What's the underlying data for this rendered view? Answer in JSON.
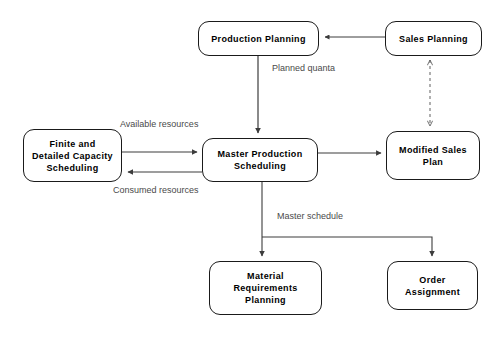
{
  "diagram": {
    "background_color": "#ffffff",
    "line_color": "#3c3c3c",
    "node_border_color": "#1a1a1a",
    "node_text_color": "#000000",
    "edge_label_color": "#4a4a4a",
    "nodes": [
      {
        "id": "production-planning",
        "label": "Production Planning"
      },
      {
        "id": "sales-planning",
        "label": "Sales Planning"
      },
      {
        "id": "finite-capacity",
        "label": "Finite and\nDetailed Capacity\nScheduling"
      },
      {
        "id": "master-production",
        "label": "Master Production\nScheduling"
      },
      {
        "id": "modified-sales",
        "label": "Modified Sales\nPlan"
      },
      {
        "id": "material-req",
        "label": "Material\nRequirements\nPlanning"
      },
      {
        "id": "order-assignment",
        "label": "Order\nAssignment"
      }
    ],
    "edges": [
      {
        "id": "sales-to-production",
        "from": "sales-planning",
        "to": "production-planning",
        "label": "",
        "style": "solid",
        "arrows": "single"
      },
      {
        "id": "production-to-mps",
        "from": "production-planning",
        "to": "master-production",
        "label": "Planned quanta",
        "style": "solid",
        "arrows": "single"
      },
      {
        "id": "fcs-to-mps",
        "from": "finite-capacity",
        "to": "master-production",
        "label": "Available resources",
        "style": "solid",
        "arrows": "single"
      },
      {
        "id": "mps-to-fcs",
        "from": "master-production",
        "to": "finite-capacity",
        "label": "Consumed resources",
        "style": "solid",
        "arrows": "single"
      },
      {
        "id": "mps-to-modified-sales",
        "from": "master-production",
        "to": "modified-sales",
        "label": "",
        "style": "solid",
        "arrows": "single"
      },
      {
        "id": "sales-modified-link",
        "from": "sales-planning",
        "to": "modified-sales",
        "label": "",
        "style": "dashed",
        "arrows": "double"
      },
      {
        "id": "mps-to-mrp",
        "from": "master-production",
        "to": "material-req",
        "label": "Master schedule",
        "style": "solid",
        "arrows": "single"
      },
      {
        "id": "mps-to-order",
        "from": "master-production",
        "to": "order-assignment",
        "label": "",
        "style": "solid",
        "arrows": "single"
      }
    ],
    "edge_labels": {
      "planned_quanta": "Planned quanta",
      "available_resources": "Available resources",
      "consumed_resources": "Consumed resources",
      "master_schedule": "Master schedule"
    }
  }
}
